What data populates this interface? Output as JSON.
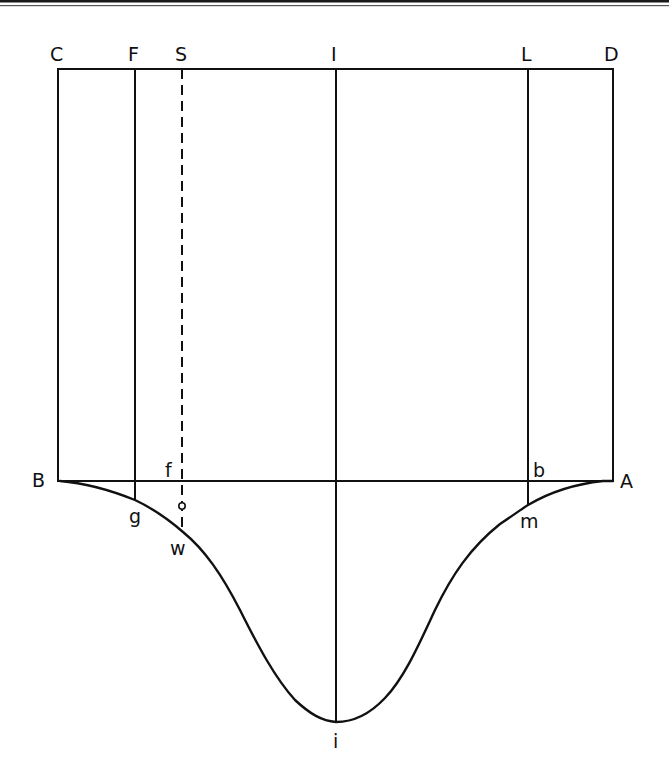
{
  "figure": {
    "type": "geometric-diagram",
    "colors": {
      "ink": "#111111",
      "background": "#ffffff"
    },
    "top_labels": {
      "C": "C",
      "F": "F",
      "S": "S",
      "I": "I",
      "L": "L",
      "D": "D"
    },
    "baseline_labels": {
      "B": "B",
      "f": "f",
      "b": "b",
      "A": "A"
    },
    "curve_labels": {
      "g": "g",
      "w": "w",
      "m": "m",
      "i": "i"
    },
    "lines": [
      {
        "name": "C-D",
        "style": "solid"
      },
      {
        "name": "C-B",
        "style": "solid"
      },
      {
        "name": "D-A",
        "style": "solid"
      },
      {
        "name": "B-A",
        "style": "solid"
      },
      {
        "name": "F-g",
        "style": "solid"
      },
      {
        "name": "S-w",
        "style": "dashed"
      },
      {
        "name": "I-i",
        "style": "solid"
      },
      {
        "name": "L-m",
        "style": "solid"
      }
    ],
    "marker": {
      "name": "small-circle-on-S-line",
      "shape": "circle"
    }
  }
}
